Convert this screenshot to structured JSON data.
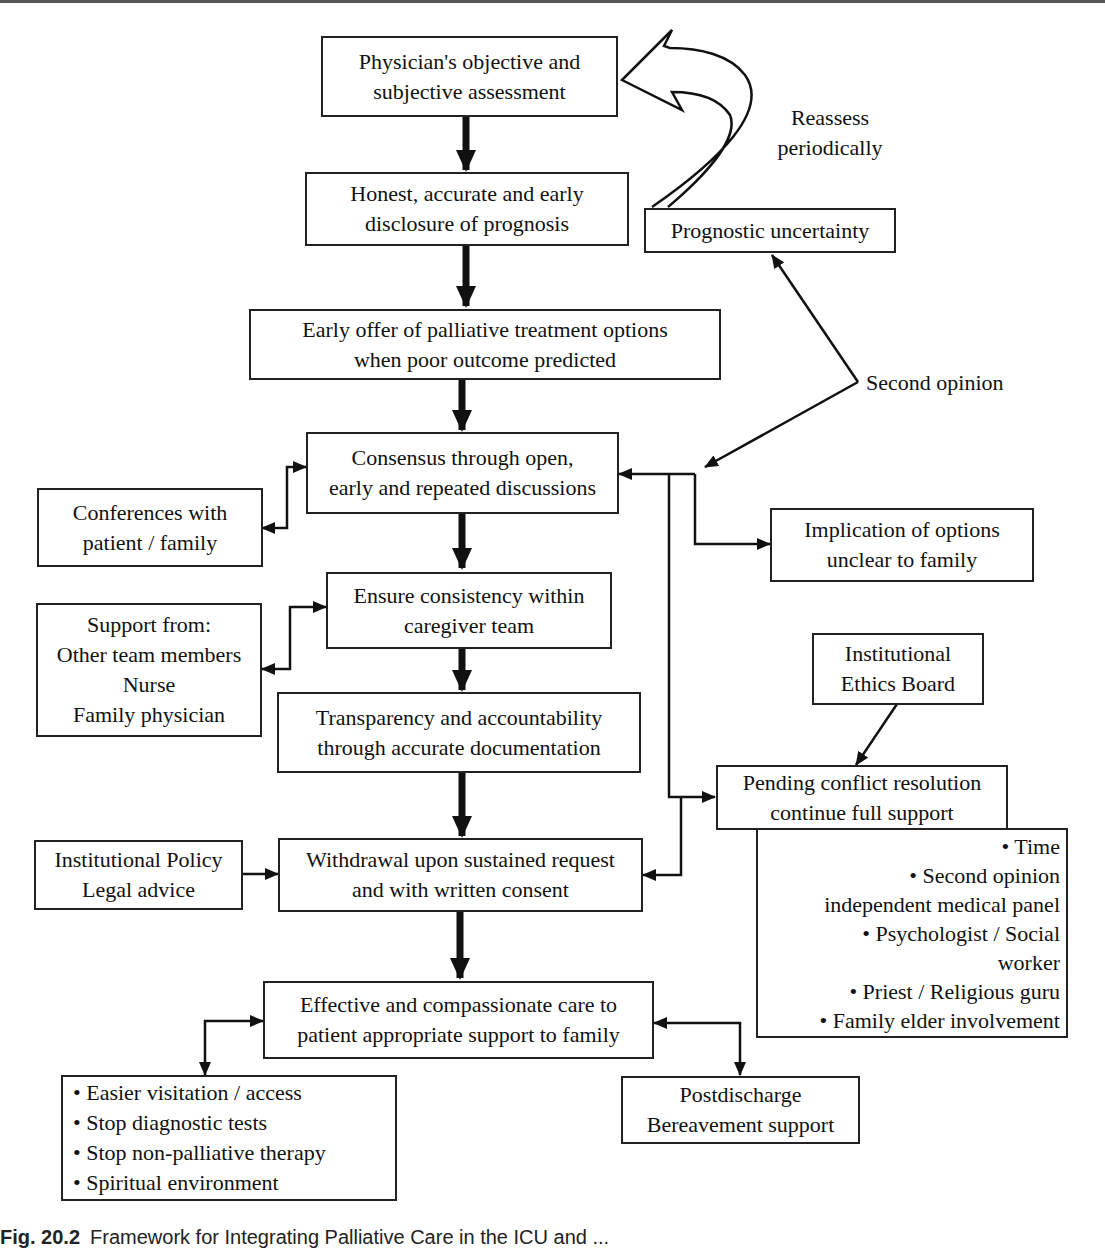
{
  "diagram": {
    "nodes": {
      "assessment": [
        "Physician's objective and",
        "subjective assessment"
      ],
      "disclosure": [
        "Honest, accurate and early",
        "disclosure of prognosis"
      ],
      "uncertainty": [
        "Prognostic uncertainty"
      ],
      "palliative_offer": [
        "Early offer of palliative treatment options",
        "when poor outcome predicted"
      ],
      "consensus": [
        "Consensus through open,",
        "early and repeated discussions"
      ],
      "conferences": [
        "Conferences with",
        "patient / family"
      ],
      "implication": [
        "Implication of options",
        "unclear to family"
      ],
      "consistency": [
        "Ensure consistency within",
        "caregiver team"
      ],
      "support_from": [
        "Support from:",
        "Other team members",
        "Nurse",
        "Family physician"
      ],
      "ethics_board": [
        "Institutional",
        "Ethics Board"
      ],
      "transparency": [
        "Transparency and accountability",
        "through accurate documentation"
      ],
      "pending": [
        "Pending conflict resolution",
        "continue full support"
      ],
      "pending_list": [
        "• Time",
        "• Second opinion",
        "independent medical panel",
        "• Psychologist / Social",
        "worker",
        "• Priest / Religious guru",
        "• Family elder involvement"
      ],
      "policy": [
        "Institutional Policy",
        "Legal advice"
      ],
      "withdrawal": [
        "Withdrawal upon sustained request",
        "and with written consent"
      ],
      "care": [
        "Effective and compassionate care to",
        "patient appropriate support to family"
      ],
      "care_list": [
        "• Easier visitation / access",
        "• Stop diagnostic tests",
        "• Stop non-palliative therapy",
        "• Spiritual environment"
      ],
      "postdischarge": [
        "Postdischarge",
        "Bereavement support"
      ]
    },
    "labels": {
      "reassess": [
        "Reassess",
        "periodically"
      ],
      "second_opinion": "Second opinion"
    },
    "edges": [
      {
        "from": "assessment",
        "to": "disclosure",
        "style": "thick"
      },
      {
        "from": "disclosure",
        "to": "palliative_offer",
        "style": "thick"
      },
      {
        "from": "palliative_offer",
        "to": "consensus",
        "style": "thick"
      },
      {
        "from": "consensus",
        "to": "consistency",
        "style": "thick"
      },
      {
        "from": "consistency",
        "to": "transparency",
        "style": "thick"
      },
      {
        "from": "transparency",
        "to": "withdrawal",
        "style": "thick"
      },
      {
        "from": "withdrawal",
        "to": "care",
        "style": "thick"
      },
      {
        "from": "uncertainty",
        "to": "assessment",
        "style": "hollow-curved",
        "label": "Reassess periodically"
      },
      {
        "from": "second_opinion",
        "to": "uncertainty",
        "style": "thin"
      },
      {
        "from": "second_opinion",
        "to": "consensus",
        "style": "thin"
      },
      {
        "from": "consensus",
        "to": "conferences",
        "style": "bidirectional"
      },
      {
        "from": "consensus",
        "to": "implication",
        "style": "thin"
      },
      {
        "from": "consensus",
        "to": "pending",
        "style": "thin"
      },
      {
        "from": "pending",
        "to": "withdrawal",
        "style": "thin"
      },
      {
        "from": "consistency",
        "to": "support_from",
        "style": "bidirectional"
      },
      {
        "from": "ethics_board",
        "to": "pending",
        "style": "thin"
      },
      {
        "from": "policy",
        "to": "withdrawal",
        "style": "thin"
      },
      {
        "from": "care",
        "to": "care_list",
        "style": "bidirectional"
      },
      {
        "from": "care",
        "to": "postdischarge",
        "style": "bidirectional"
      }
    ]
  },
  "caption": {
    "number": "Fig. 20.2",
    "text": "Framework for Integrating Palliative Care in the ICU and ..."
  }
}
